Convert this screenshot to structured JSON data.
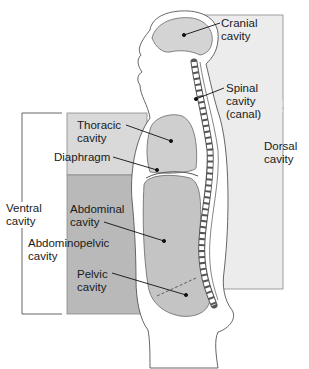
{
  "diagram": {
    "colors": {
      "dorsal_region": "#ececec",
      "thoracic_region": "#d9d9d9",
      "abdominopelvic_region": "#b9b9b9",
      "organ_fill": "#cfcfcf",
      "outline": "#555555",
      "label_text": "#1a1a1a"
    },
    "labels": {
      "cranial": "Cranial\ncavity",
      "spinal": "Spinal\ncavity\n(canal)",
      "dorsal": "Dorsal\ncavity",
      "thoracic": "Thoracic\ncavity",
      "diaphragm": "Diaphragm",
      "ventral": "Ventral\ncavity",
      "abdominal": "Abdominal\ncavity",
      "abdominopelvic": "Abdominopelvic\ncavity",
      "pelvic": "Pelvic\ncavity"
    }
  }
}
